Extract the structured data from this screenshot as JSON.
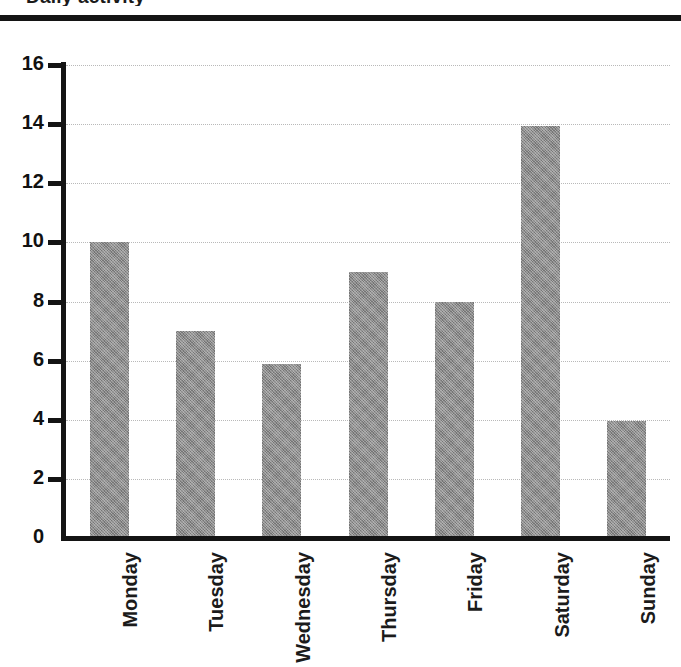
{
  "page": {
    "background_color": "#ffffff",
    "rule_color": "#141414",
    "cropped_title_fragment": "Daily activity"
  },
  "chart_data": {
    "type": "bar",
    "title": "",
    "xlabel": "",
    "ylabel": "",
    "categories": [
      "Monday",
      "Tuesday",
      "Wednesday",
      "Thursday",
      "Friday",
      "Saturday",
      "Sunday"
    ],
    "values": [
      10,
      7,
      5.9,
      9,
      8,
      13.95,
      3.95
    ],
    "ylim": [
      0,
      16
    ],
    "ytick_labels": [
      "0",
      "2",
      "4",
      "6",
      "8",
      "10",
      "12",
      "14",
      "16"
    ],
    "ytick_values": [
      0,
      2,
      4,
      6,
      8,
      10,
      12,
      14,
      16
    ],
    "grid": true,
    "grid_style": "dotted",
    "grid_color": "#b9b9b9",
    "legend": false,
    "bar_color": "#8c8c8c",
    "axis_color": "#141414",
    "tick_label_rotation": 90
  }
}
